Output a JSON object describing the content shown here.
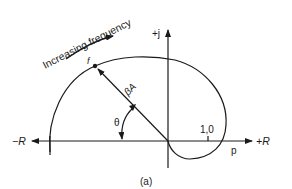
{
  "figure": {
    "caption": "(a)",
    "axes": {
      "negative_real_label": "−R",
      "positive_real_label": "+R",
      "positive_imag_label": "+j",
      "unit_point_label": "1,0"
    },
    "annotations": {
      "direction_label": "Increasing frequency",
      "frequency_point_label": "f",
      "vector_label": "βA",
      "angle_label": "θ",
      "crossing_point_label": "p"
    },
    "colors": {
      "line": "#1a1a1a",
      "background": "#ffffff"
    }
  }
}
